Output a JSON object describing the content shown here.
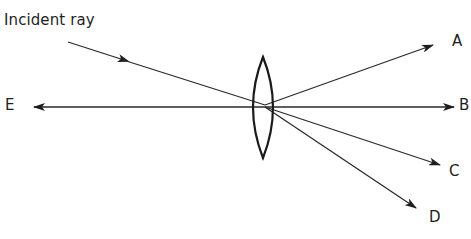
{
  "diagram": {
    "incident_label": "Incident ray",
    "lens": {
      "type": "convex lens",
      "center": [
        263,
        107
      ],
      "half_width": 11,
      "top_y": 57,
      "bottom_y": 158
    },
    "optical_axis": {
      "from": [
        33,
        107
      ],
      "to": [
        458,
        107
      ]
    },
    "incident_ray": {
      "from": [
        68,
        42
      ],
      "to": [
        265,
        105
      ],
      "arrow_at": [
        122,
        59
      ]
    },
    "outgoing_rays": [
      {
        "label": "A",
        "from": [
          265,
          105
        ],
        "to": [
          433,
          45
        ]
      },
      {
        "label": "B",
        "from": [
          265,
          107
        ],
        "to": [
          452,
          107
        ]
      },
      {
        "label": "C",
        "from": [
          265,
          107
        ],
        "to": [
          440,
          164
        ]
      },
      {
        "label": "D",
        "from": [
          265,
          107
        ],
        "to": [
          415,
          207
        ]
      }
    ],
    "backward_ray": {
      "label": "E",
      "from": [
        265,
        107
      ],
      "to": [
        33,
        107
      ]
    },
    "labels": {
      "a": "A",
      "b": "B",
      "c": "C",
      "d": "D",
      "e": "E"
    },
    "colors": {
      "line": "#2a2a2a",
      "lens": "#1a1a1a",
      "text": "#1e1e1e",
      "background": "#ffffff"
    }
  }
}
